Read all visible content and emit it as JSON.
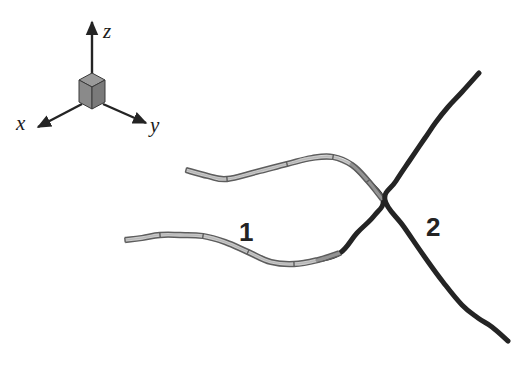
{
  "figure": {
    "background_color": "#ffffff",
    "width": 530,
    "height": 368,
    "ink_color": "#242424",
    "ribbon_color": "#5d5d5d",
    "ribbon_fill": "#b8b8b8"
  },
  "axes": {
    "name": "coordinate-frame",
    "origin": {
      "x": 92,
      "y": 95
    },
    "cube": {
      "name": "origin-cube",
      "top_face_color": "#9a9a9a",
      "left_face_color": "#8a8a8a",
      "right_face_color": "#7a7a7a",
      "edge_color": "#3a3a3a",
      "half_width": 13,
      "top_rise": 7,
      "body_height": 15
    },
    "items": [
      {
        "label": "z",
        "name": "axis-z",
        "from": {
          "x": 92,
          "y": 88
        },
        "to": {
          "x": 92,
          "y": 22
        },
        "label_pos": {
          "x": 103,
          "y": 38
        },
        "label_size": 21
      },
      {
        "label": "x",
        "name": "axis-x",
        "from": {
          "x": 82,
          "y": 104
        },
        "to": {
          "x": 38,
          "y": 127
        },
        "label_pos": {
          "x": 16,
          "y": 130
        },
        "label_size": 21
      },
      {
        "label": "y",
        "name": "axis-y",
        "from": {
          "x": 103,
          "y": 104
        },
        "to": {
          "x": 146,
          "y": 123
        },
        "label_pos": {
          "x": 150,
          "y": 132
        },
        "label_size": 21
      }
    ]
  },
  "curves": [
    {
      "id": "1",
      "name": "curve-one",
      "style": "segmented-ribbon",
      "label": "1",
      "label_pos": {
        "x": 239,
        "y": 241
      },
      "label_size": 26,
      "description": "Faceted tube-like space curve entering from upper left, bending right and hooking downward past the crossing, then running back to the lower left.",
      "points": [
        {
          "x": 186,
          "y": 170
        },
        {
          "x": 208,
          "y": 176
        },
        {
          "x": 227,
          "y": 179
        },
        {
          "x": 256,
          "y": 172
        },
        {
          "x": 287,
          "y": 164
        },
        {
          "x": 312,
          "y": 158
        },
        {
          "x": 333,
          "y": 157
        },
        {
          "x": 352,
          "y": 165
        },
        {
          "x": 368,
          "y": 181
        },
        {
          "x": 383,
          "y": 200
        },
        {
          "x": 374,
          "y": 216
        },
        {
          "x": 357,
          "y": 233
        },
        {
          "x": 340,
          "y": 253
        },
        {
          "x": 318,
          "y": 260
        },
        {
          "x": 294,
          "y": 264
        },
        {
          "x": 271,
          "y": 262
        },
        {
          "x": 248,
          "y": 252
        },
        {
          "x": 225,
          "y": 242
        },
        {
          "x": 203,
          "y": 236
        },
        {
          "x": 180,
          "y": 235
        },
        {
          "x": 160,
          "y": 235
        },
        {
          "x": 142,
          "y": 238
        },
        {
          "x": 125,
          "y": 240
        }
      ],
      "ribbon_end_index": 17,
      "ribbon_half_width": 2.4
    },
    {
      "id": "2",
      "name": "curve-two",
      "style": "solid-line",
      "label": "2",
      "label_pos": {
        "x": 426,
        "y": 236
      },
      "label_size": 26,
      "description": "Solid dark space curve descending from upper right through the crossing point to the lower right.",
      "stroke_width": 5,
      "points": [
        {
          "x": 479,
          "y": 73
        },
        {
          "x": 462,
          "y": 92
        },
        {
          "x": 448,
          "y": 107
        },
        {
          "x": 436,
          "y": 122
        },
        {
          "x": 425,
          "y": 138
        },
        {
          "x": 410,
          "y": 160
        },
        {
          "x": 396,
          "y": 181
        },
        {
          "x": 385,
          "y": 200
        },
        {
          "x": 404,
          "y": 227
        },
        {
          "x": 424,
          "y": 256
        },
        {
          "x": 443,
          "y": 282
        },
        {
          "x": 462,
          "y": 305
        },
        {
          "x": 478,
          "y": 318
        },
        {
          "x": 492,
          "y": 327
        },
        {
          "x": 508,
          "y": 341
        }
      ]
    }
  ],
  "crossing_point": {
    "x": 385,
    "y": 200,
    "name": "curve-intersection"
  }
}
